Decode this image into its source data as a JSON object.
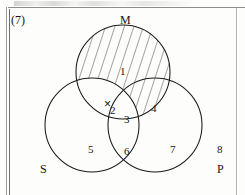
{
  "figure": {
    "question_number": "(7)",
    "type": "venn-diagram",
    "set_count": 3,
    "ink_color": "#1a1a1a",
    "background_color": "#fdfdfc"
  },
  "sets": [
    {
      "id": "M",
      "label": "M",
      "label_x": 120,
      "label_y": 14,
      "cx": 123,
      "cy": 72,
      "r": 47,
      "shaded": true
    },
    {
      "id": "S",
      "label": "S",
      "label_x": 40,
      "label_y": 163,
      "cx": 92,
      "cy": 125,
      "r": 47,
      "shaded": false
    },
    {
      "id": "P",
      "label": "P",
      "label_x": 217,
      "label_y": 163,
      "cx": 155,
      "cy": 125,
      "r": 47,
      "shaded": false
    }
  ],
  "regions": [
    {
      "id": "r1",
      "label": "1",
      "x": 120,
      "y": 66,
      "belongs": "M only",
      "shaded": true
    },
    {
      "id": "r2",
      "label": "2",
      "x": 110,
      "y": 105,
      "belongs": "M and S",
      "shaded": false
    },
    {
      "id": "r3",
      "label": "3",
      "x": 124,
      "y": 114,
      "belongs": "M and S and P",
      "shaded": false
    },
    {
      "id": "r4",
      "label": "4",
      "x": 151,
      "y": 103,
      "belongs": "M and P",
      "shaded": true
    },
    {
      "id": "r5",
      "label": "5",
      "x": 88,
      "y": 144,
      "belongs": "S only",
      "shaded": false
    },
    {
      "id": "r6",
      "label": "6",
      "x": 124,
      "y": 146,
      "belongs": "S and P",
      "shaded": false
    },
    {
      "id": "r7",
      "label": "7",
      "x": 170,
      "y": 144,
      "belongs": "P only",
      "shaded": false
    },
    {
      "id": "r8",
      "label": "8",
      "x": 217,
      "y": 144,
      "belongs": "outside all",
      "shaded": false
    }
  ],
  "marks": [
    {
      "id": "x-mark",
      "symbol": "×",
      "x": 104,
      "y": 98,
      "in_region": "2"
    }
  ],
  "shading": {
    "style": "diagonal-hatching",
    "description": "Parallel diagonal lines filling circle M outside S",
    "angle_deg": 72,
    "spacing_px": 9,
    "stroke": "#2b2b2b"
  }
}
